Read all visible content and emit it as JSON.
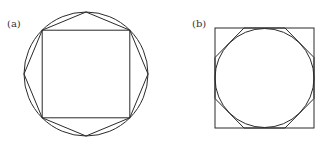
{
  "figures": [
    {
      "id": "a",
      "label": "(a)",
      "description": "Square inscribed in circle with inscribed octagon",
      "shapes": [
        "circle",
        "inscribed-square",
        "inscribed-octagon"
      ]
    },
    {
      "id": "b",
      "label": "(b)",
      "description": "Circle inscribed in square with circumscribed octagon",
      "shapes": [
        "square",
        "inscribed-circle",
        "circumscribed-octagon"
      ]
    }
  ],
  "colors": {
    "stroke": "#2a2a2a",
    "background": "#ffffff",
    "label": "#333333"
  }
}
